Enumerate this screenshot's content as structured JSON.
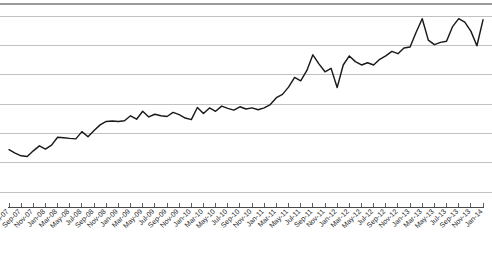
{
  "chart_data": {
    "type": "line",
    "title": "",
    "xlabel": "",
    "ylabel": "",
    "grid": true,
    "legend": false,
    "legend_position": "none",
    "x_tick_rotation_deg": 45,
    "x_tick_interval_months": 2,
    "y_tick_labels": [],
    "gridline_count": 7,
    "series_color": "#1a1a1a",
    "gridline_color": "#b3b3b3",
    "axis_color": "#4a4a4a",
    "background_color": "#ffffff",
    "x": [
      "Jul-07",
      "Aug-07",
      "Sep-07",
      "Oct-07",
      "Nov-07",
      "Dec-07",
      "Jan-08",
      "Feb-08",
      "Mar-08",
      "Apr-08",
      "May-08",
      "Jun-08",
      "Jul-08",
      "Aug-08",
      "Sep-08",
      "Oct-08",
      "Nov-08",
      "Dec-08",
      "Jan-09",
      "Feb-09",
      "Mar-09",
      "Apr-09",
      "May-09",
      "Jun-09",
      "Jul-09",
      "Aug-09",
      "Sep-09",
      "Oct-09",
      "Nov-09",
      "Dec-09",
      "Jan-10",
      "Feb-10",
      "Mar-10",
      "Apr-10",
      "May-10",
      "Jun-10",
      "Jul-10",
      "Aug-10",
      "Sep-10",
      "Oct-10",
      "Nov-10",
      "Dec-10",
      "Jan-11",
      "Feb-11",
      "Mar-11",
      "Apr-11",
      "May-11",
      "Jun-11",
      "Jul-11",
      "Aug-11",
      "Sep-11",
      "Oct-11",
      "Nov-11",
      "Dec-11",
      "Jan-12",
      "Feb-12",
      "Mar-12",
      "Apr-12",
      "May-12",
      "Jun-12",
      "Jul-12",
      "Aug-12",
      "Sep-12",
      "Oct-12",
      "Nov-12",
      "Dec-12",
      "Jan-13",
      "Feb-13",
      "Mar-13",
      "Apr-13",
      "May-13",
      "Jun-13",
      "Jul-13",
      "Aug-13",
      "Sep-13",
      "Oct-13",
      "Nov-13",
      "Dec-13",
      "Jan-14"
    ],
    "x_tick_labels": [
      "Jul-07",
      "Sep-07",
      "Nov-07",
      "Jan-08",
      "Mar-08",
      "May-08",
      "Jul-08",
      "Sep-08",
      "Nov-08",
      "Jan-09",
      "Mar-09",
      "May-09",
      "Jul-09",
      "Sep-09",
      "Nov-09",
      "Jan-10",
      "Mar-10",
      "May-10",
      "Jul-10",
      "Sep-10",
      "Nov-10",
      "Jan-11",
      "Mar-11",
      "May-11",
      "Jul-11",
      "Sep-11",
      "Nov-11",
      "Jan-12",
      "Mar-12",
      "May-12",
      "Jul-12",
      "Sep-12",
      "Nov-12",
      "Jan-13",
      "Mar-13",
      "May-13",
      "Jul-13",
      "Sep-13",
      "Nov-13",
      "Jan-14"
    ],
    "values": [
      20.5,
      19.0,
      17.8,
      17.5,
      20.0,
      22.2,
      20.8,
      22.5,
      26.0,
      25.8,
      25.5,
      25.3,
      28.5,
      26.2,
      29.0,
      31.5,
      33.0,
      33.2,
      33.0,
      33.3,
      35.5,
      34.0,
      37.5,
      35.0,
      36.2,
      35.5,
      35.2,
      37.0,
      36.0,
      34.5,
      33.8,
      39.2,
      36.5,
      39.0,
      37.5,
      39.8,
      38.8,
      38.0,
      39.5,
      38.5,
      39.0,
      38.2,
      39.0,
      40.5,
      43.5,
      45.0,
      48.2,
      52.5,
      51.0,
      55.5,
      62.5,
      58.5,
      55.0,
      56.5,
      48.0,
      58.0,
      62.0,
      59.5,
      58.0,
      59.0,
      58.0,
      60.5,
      62.0,
      64.0,
      63.0,
      65.5,
      66.0,
      72.5,
      78.5,
      69.0,
      67.0,
      68.0,
      68.5,
      75.0,
      78.5,
      77.0,
      73.0,
      66.5,
      78.0
    ],
    "ylim": [
      0,
      85
    ],
    "xlim_first": "Jul-07",
    "xlim_last": "Jan-14"
  }
}
